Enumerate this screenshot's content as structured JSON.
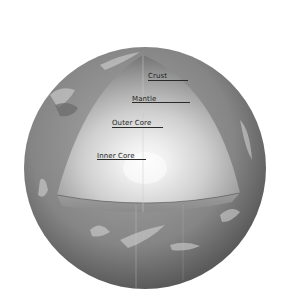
{
  "diagram": {
    "colors": {
      "background": "#ffffff",
      "globe_surface": "#8a8a8a",
      "cutaway_inner": "#f2f2f2",
      "cutaway_outer": "#6e6e6e",
      "label_text": "#1e1e1e"
    },
    "labels": [
      {
        "id": "crust",
        "text": "Crust"
      },
      {
        "id": "mantle",
        "text": "Mantle"
      },
      {
        "id": "outer_core",
        "text": "Outer Core"
      },
      {
        "id": "inner_core",
        "text": "Inner Core"
      }
    ]
  }
}
